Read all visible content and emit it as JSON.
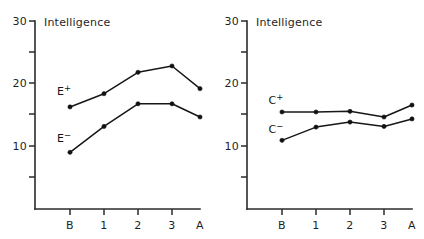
{
  "figure": {
    "background_color": "#ffffff",
    "ink_color": "#171717",
    "panel_count": 2
  },
  "chart_data": [
    {
      "type": "line",
      "panel": "left",
      "title": "Intelligence",
      "xlabel": "",
      "ylabel": "Intelligence",
      "categories": [
        "B",
        "1",
        "2",
        "3",
        "A"
      ],
      "xtick_labels": [
        "B",
        "1",
        "2",
        "3",
        "A"
      ],
      "ytick_labels": [
        "30",
        "20",
        "10"
      ],
      "ytick_values": [
        30,
        20,
        10
      ],
      "yminor_ticks": [
        25,
        15,
        5
      ],
      "ylim": [
        3,
        30
      ],
      "grid": false,
      "legend_position": "inline-left",
      "series": [
        {
          "name": "E+",
          "label": "E",
          "superscript": "+",
          "values": [
            16.2,
            18.3,
            21.7,
            22.7,
            19.1
          ],
          "color": "#171717",
          "marker": "filled-circle"
        },
        {
          "name": "E−",
          "label": "E",
          "superscript": "−",
          "values": [
            9.0,
            13.1,
            16.7,
            16.7,
            14.6
          ],
          "color": "#171717",
          "marker": "filled-circle"
        }
      ]
    },
    {
      "type": "line",
      "panel": "right",
      "title": "Intelligence",
      "xlabel": "",
      "ylabel": "Intelligence",
      "categories": [
        "B",
        "1",
        "2",
        "3",
        "A"
      ],
      "xtick_labels": [
        "B",
        "1",
        "2",
        "3",
        "A"
      ],
      "ytick_labels": [
        "30",
        "20",
        "10"
      ],
      "ytick_values": [
        30,
        20,
        10
      ],
      "yminor_ticks": [
        25,
        15,
        5
      ],
      "ylim": [
        3,
        30
      ],
      "grid": false,
      "legend_position": "inline-left",
      "series": [
        {
          "name": "C+",
          "label": "C",
          "superscript": "+",
          "values": [
            15.4,
            15.4,
            15.5,
            14.6,
            16.5
          ],
          "color": "#171717",
          "marker": "filled-circle"
        },
        {
          "name": "C−",
          "label": "C",
          "superscript": "−",
          "values": [
            10.9,
            13.0,
            13.8,
            13.1,
            14.3
          ],
          "color": "#171717",
          "marker": "filled-circle"
        }
      ]
    }
  ],
  "panels": {
    "left": {
      "title": "Intelligence",
      "y_labels": {
        "top": "30",
        "mid": "20",
        "bottom": "10"
      },
      "x_labels": {
        "t0": "B",
        "t1": "1",
        "t2": "2",
        "t3": "3",
        "t4": "A"
      },
      "series_labels": {
        "upper_base": "E",
        "upper_sup": "+",
        "lower_base": "E",
        "lower_sup": "−"
      }
    },
    "right": {
      "title": "Intelligence",
      "y_labels": {
        "top": "30",
        "mid": "20",
        "bottom": "10"
      },
      "x_labels": {
        "t0": "B",
        "t1": "1",
        "t2": "2",
        "t3": "3",
        "t4": "A"
      },
      "series_labels": {
        "upper_base": "C",
        "upper_sup": "+",
        "lower_base": "C",
        "lower_sup": "−"
      }
    }
  }
}
